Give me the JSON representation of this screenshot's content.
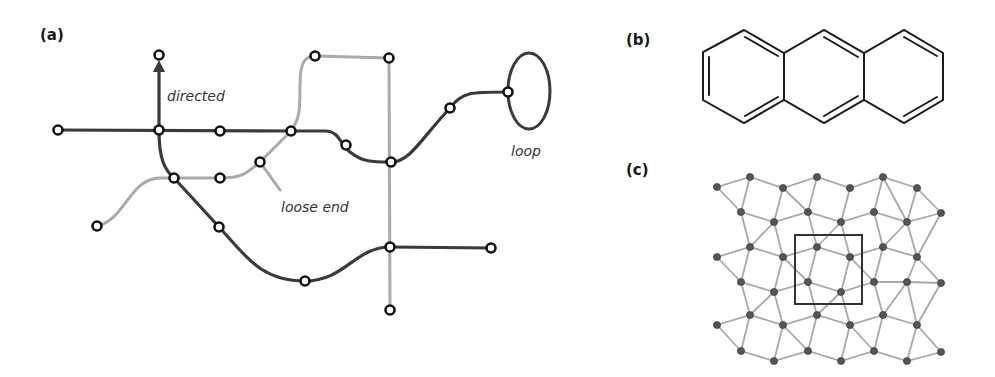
{
  "figure": {
    "panels": [
      {
        "id": "a",
        "label": "(a)"
      },
      {
        "id": "b",
        "label": "(b)"
      },
      {
        "id": "c",
        "label": "(c)"
      }
    ],
    "annotations": {
      "directed": "directed",
      "loop": "loop",
      "loose_end": "loose end"
    },
    "colors": {
      "dark_edge": "#3a3a3a",
      "light_edge": "#a9a9a9",
      "node_stroke": "#111111",
      "lattice_edge": "#a8a8a8",
      "lattice_node": "#555555"
    }
  },
  "panel_a": {
    "description": "Network of nodes and edges illustrating directed edge, self-loop, and loose end",
    "nodes": [
      [
        58,
        130
      ],
      [
        159,
        130
      ],
      [
        159,
        55
      ],
      [
        220,
        131
      ],
      [
        291,
        131
      ],
      [
        174,
        178
      ],
      [
        220,
        178
      ],
      [
        260,
        162
      ],
      [
        97,
        226
      ],
      [
        219,
        227
      ],
      [
        305,
        281
      ],
      [
        315,
        56
      ],
      [
        389,
        58
      ],
      [
        346,
        145
      ],
      [
        391,
        162
      ],
      [
        450,
        108
      ],
      [
        508,
        92
      ],
      [
        390,
        247
      ],
      [
        491,
        248
      ],
      [
        390,
        310
      ]
    ]
  },
  "panel_b": {
    "description": "Anthracene molecule (three fused benzene rings)"
  },
  "panel_c": {
    "description": "2D lattice network with highlighted unit cell",
    "nodes": [
      [
        717,
        187
      ],
      [
        750,
        177
      ],
      [
        783,
        188
      ],
      [
        817,
        177
      ],
      [
        850,
        188
      ],
      [
        883,
        177
      ],
      [
        917,
        188
      ],
      [
        741,
        212
      ],
      [
        774,
        222
      ],
      [
        808,
        212
      ],
      [
        841,
        222
      ],
      [
        874,
        212
      ],
      [
        907,
        222
      ],
      [
        941,
        213
      ],
      [
        717,
        257
      ],
      [
        750,
        247
      ],
      [
        783,
        257
      ],
      [
        817,
        247
      ],
      [
        850,
        257
      ],
      [
        883,
        247
      ],
      [
        917,
        257
      ],
      [
        741,
        282
      ],
      [
        774,
        292
      ],
      [
        808,
        282
      ],
      [
        841,
        292
      ],
      [
        874,
        282
      ],
      [
        907,
        282
      ],
      [
        941,
        283
      ],
      [
        717,
        325
      ],
      [
        750,
        315
      ],
      [
        783,
        325
      ],
      [
        817,
        315
      ],
      [
        850,
        325
      ],
      [
        883,
        315
      ],
      [
        917,
        325
      ],
      [
        741,
        351
      ],
      [
        774,
        361
      ],
      [
        808,
        351
      ],
      [
        841,
        361
      ],
      [
        874,
        351
      ],
      [
        907,
        361
      ],
      [
        941,
        352
      ]
    ],
    "unit_cell": {
      "x": 795,
      "y": 235,
      "width": 67,
      "height": 69
    }
  }
}
